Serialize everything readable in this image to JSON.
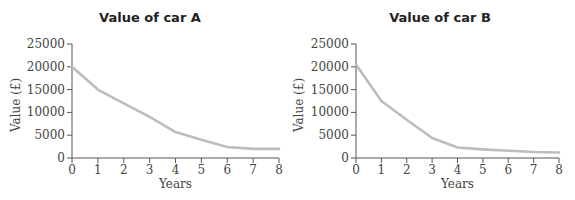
{
  "chart_data": [
    {
      "type": "line",
      "title": "Value of car A",
      "xlabel": "Years",
      "ylabel": "Value (£)",
      "x": [
        0,
        1,
        2,
        3,
        4,
        5,
        6,
        7,
        8
      ],
      "x_ticks": [
        "0",
        "1",
        "2",
        "3",
        "4",
        "5",
        "6",
        "7",
        "8"
      ],
      "y_ticks": [
        "0",
        "5000",
        "10000",
        "15000",
        "20000",
        "25000"
      ],
      "xlim": [
        0,
        8
      ],
      "ylim": [
        0,
        25000
      ],
      "grid": false,
      "series": [
        {
          "name": "Car A",
          "values": [
            20000,
            15000,
            12000,
            9000,
            5700,
            4000,
            2400,
            2000,
            2000
          ],
          "color": "#bdbdbd"
        }
      ]
    },
    {
      "type": "line",
      "title": "Value of car B",
      "xlabel": "Years",
      "ylabel": "Value (£)",
      "x": [
        0,
        1,
        2,
        3,
        4,
        5,
        6,
        7,
        8
      ],
      "x_ticks": [
        "0",
        "1",
        "2",
        "3",
        "4",
        "5",
        "6",
        "7",
        "8"
      ],
      "y_ticks": [
        "0",
        "5000",
        "10000",
        "15000",
        "20000",
        "25000"
      ],
      "xlim": [
        0,
        8
      ],
      "ylim": [
        0,
        25000
      ],
      "grid": false,
      "series": [
        {
          "name": "Car B",
          "values": [
            20500,
            12500,
            8400,
            4400,
            2300,
            1900,
            1600,
            1300,
            1200
          ],
          "color": "#bdbdbd"
        }
      ]
    }
  ]
}
